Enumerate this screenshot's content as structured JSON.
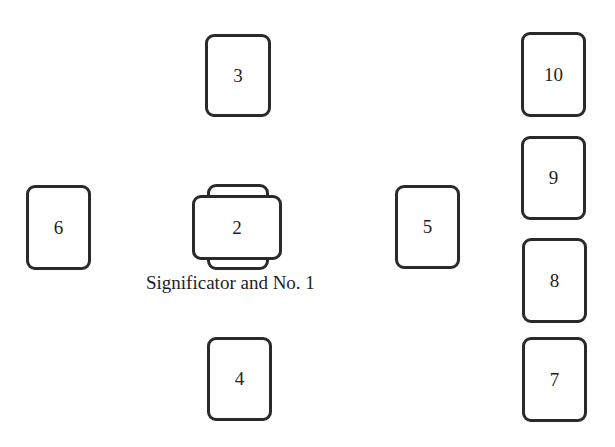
{
  "diagram": {
    "type": "tarot-spread",
    "cards": [
      {
        "id": "significator",
        "label": "",
        "x": 207,
        "y": 184,
        "w": 62,
        "h": 86
      },
      {
        "id": "1-crossing",
        "label": "2",
        "x": 192,
        "y": 195,
        "w": 90,
        "h": 65
      },
      {
        "id": "3",
        "label": "3",
        "x": 205,
        "y": 34,
        "w": 66,
        "h": 83
      },
      {
        "id": "4",
        "label": "4",
        "x": 207,
        "y": 337,
        "w": 65,
        "h": 84
      },
      {
        "id": "5",
        "label": "5",
        "x": 395,
        "y": 185,
        "w": 65,
        "h": 84
      },
      {
        "id": "6",
        "label": "6",
        "x": 26,
        "y": 185,
        "w": 65,
        "h": 85
      },
      {
        "id": "7",
        "label": "7",
        "x": 522,
        "y": 337,
        "w": 65,
        "h": 85
      },
      {
        "id": "8",
        "label": "8",
        "x": 522,
        "y": 238,
        "w": 65,
        "h": 85
      },
      {
        "id": "9",
        "label": "9",
        "x": 521,
        "y": 136,
        "w": 65,
        "h": 84
      },
      {
        "id": "10",
        "label": "10",
        "x": 521,
        "y": 32,
        "w": 65,
        "h": 85
      }
    ],
    "caption": "Significator and No. 1"
  }
}
